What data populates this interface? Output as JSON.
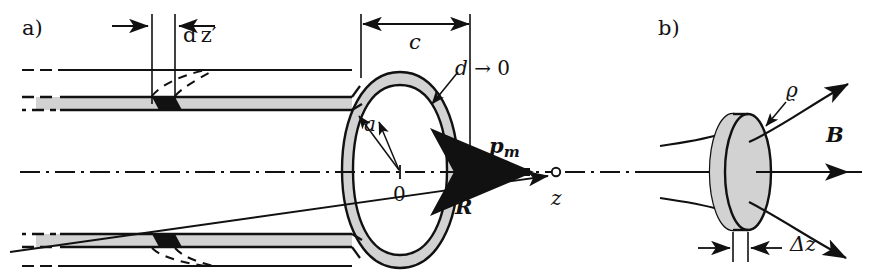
{
  "figure": {
    "type": "physics-schematic",
    "background_color": "#ffffff",
    "ink_color": "#111111",
    "shading_color": "#d0d0d0"
  },
  "panel_a": {
    "label": "a)",
    "labels": {
      "dz_prime": "d z′",
      "c": "c",
      "d_to_zero": "d → 0",
      "a": "a",
      "origin": "0",
      "p_m": "p",
      "p_m_sub": "m",
      "R": "R",
      "z": "z"
    },
    "description": "Longitudinal cross-section of a thin circular coil of radius a and axial extent c, wall thickness d → 0, with element d z′, magnetic moment p_m along the z axis and field point at distance R."
  },
  "panel_b": {
    "label": "b)",
    "labels": {
      "rho": "ϱ",
      "B": "B",
      "delta_z": "Δz"
    },
    "description": "Disk of radius ϱ and thickness Δz threaded by magnetic flux lines B."
  }
}
